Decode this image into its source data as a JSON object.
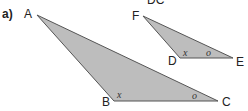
{
  "part_label": "a)",
  "top_cut_text": "DC",
  "fill_color": "#bdbdbd",
  "stroke_color": "#555555",
  "triangle_abc": {
    "vertices": {
      "A": [
        37,
        15
      ],
      "B": [
        114,
        101
      ],
      "C": [
        218,
        101
      ]
    },
    "labels": {
      "A": "A",
      "B": "B",
      "C": "C"
    },
    "angle_B": "x",
    "angle_C": "o"
  },
  "triangle_def": {
    "vertices": {
      "F": [
        143,
        16
      ],
      "D": [
        180,
        58
      ],
      "E": [
        233,
        58
      ]
    },
    "labels": {
      "F": "F",
      "D": "D",
      "E": "E"
    },
    "angle_D": "x",
    "angle_E": "o"
  }
}
